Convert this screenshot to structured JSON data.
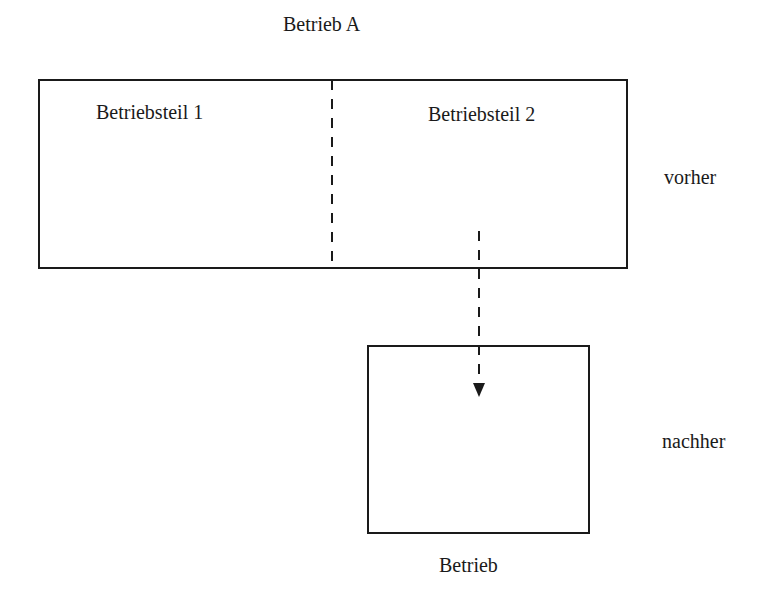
{
  "diagram": {
    "title": "Betrieb A",
    "source_box": {
      "parts": [
        {
          "label": "Betriebsteil 1"
        },
        {
          "label": "Betriebsteil 2"
        }
      ]
    },
    "target_box": {
      "label": "Betrieb"
    },
    "states": {
      "before": "vorher",
      "after": "nachher"
    },
    "arrow": {
      "from": "Betriebsteil 2",
      "to": "Betrieb",
      "style": "dashed"
    },
    "colors": {
      "line": "#1a1a1a",
      "background": "#ffffff"
    }
  }
}
